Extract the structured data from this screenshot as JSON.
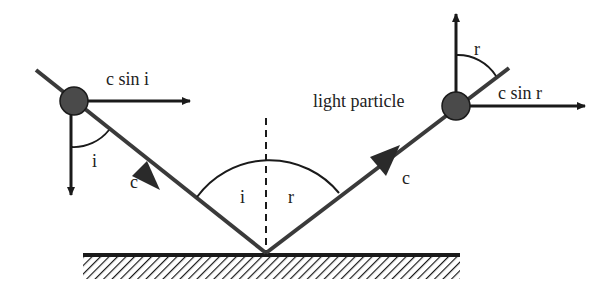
{
  "diagram": {
    "labels": {
      "c_sin_i": "c sin i",
      "c_sin_r": "c sin r",
      "light_particle": "light particle",
      "incident_speed": "c",
      "reflected_speed": "c",
      "angle_i_particle": "i",
      "angle_r_particle": "r",
      "angle_i_surface": "i",
      "angle_r_surface": "r"
    },
    "colors": {
      "stroke": "#1a1a1a",
      "ray": "#3a3a3a",
      "particle": "#4a4a4a"
    }
  }
}
